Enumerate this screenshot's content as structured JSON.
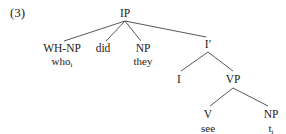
{
  "example_number": "(3)",
  "tree": {
    "root": "IP",
    "nodes": {
      "ip": "IP",
      "whnp": "WH-NP",
      "did": "did",
      "np_subject": "NP",
      "i_bar": "I′",
      "i": "I",
      "vp": "VP",
      "v": "V",
      "np_object": "NP"
    },
    "leaves": {
      "who": {
        "text": "who",
        "index": "i"
      },
      "they": {
        "text": "they"
      },
      "see": {
        "text": "see"
      },
      "trace": {
        "text": "t",
        "index": "i"
      }
    },
    "edges": [
      [
        "IP",
        "WH-NP"
      ],
      [
        "IP",
        "did"
      ],
      [
        "IP",
        "NP"
      ],
      [
        "IP",
        "I′"
      ],
      [
        "I′",
        "I"
      ],
      [
        "I′",
        "VP"
      ],
      [
        "VP",
        "V"
      ],
      [
        "VP",
        "NP"
      ]
    ]
  },
  "colors": {
    "line": "#333333",
    "text": "#222222",
    "background": "#ffffff"
  }
}
